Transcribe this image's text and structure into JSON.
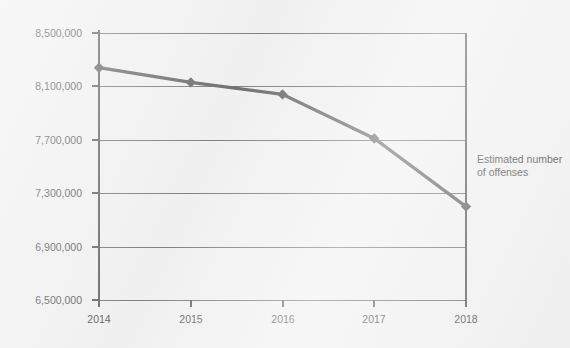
{
  "chart_data": {
    "type": "line",
    "title": "",
    "subtitle": "",
    "xlabel": "",
    "ylabel": "",
    "categories": [
      "2014",
      "2015",
      "2016",
      "2017",
      "2018"
    ],
    "x": [
      2014,
      2015,
      2016,
      2017,
      2018
    ],
    "values": [
      8240000,
      8130000,
      8040000,
      7710000,
      7200000
    ],
    "series": [
      {
        "name": "Estimated number of offenses",
        "values": [
          8240000,
          8130000,
          8040000,
          7710000,
          7200000
        ]
      }
    ],
    "ylim": [
      6500000,
      8500000
    ],
    "ytick_step": 400000,
    "ytick_labels": [
      "8,500,000",
      "8,100,000",
      "7,700,000",
      "7,300,000",
      "6,900,000",
      "6,500,000"
    ],
    "ytick_values": [
      8500000,
      8100000,
      7700000,
      7300000,
      6900000,
      6500000
    ],
    "xtick_labels": [
      "2014",
      "2015",
      "2016",
      "2017",
      "2018"
    ],
    "grid": true,
    "grid_axis": "y",
    "legend_position": "right-inline",
    "marker": "diamond",
    "line_color": "#5a5a5a",
    "grid_color": "#6d6d6d",
    "axis_color": "#555555",
    "text_color": "#4a4a4a",
    "background_color": "#efefef"
  },
  "annotation": {
    "line1": "Estimated number",
    "line2": "of offenses"
  }
}
